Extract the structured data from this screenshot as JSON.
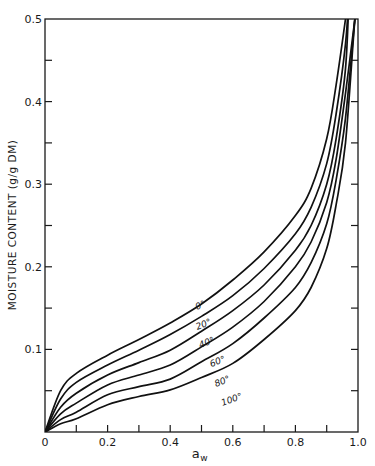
{
  "chart_data": {
    "type": "line",
    "title": "",
    "xlabel": "a_w",
    "xlabel_main": "a",
    "xlabel_sub": "w",
    "ylabel": "MOISTURE CONTENT (g/g DM)",
    "xlim": [
      0,
      1.0
    ],
    "ylim": [
      0,
      0.5
    ],
    "grid": false,
    "legend_position": "inline labels on curves",
    "x_ticks": [
      0,
      0.1,
      0.2,
      0.3,
      0.4,
      0.5,
      0.6,
      0.7,
      0.8,
      0.9,
      1.0
    ],
    "x_tick_labels": [
      "0",
      "",
      "0.2",
      "",
      "0.4",
      "",
      "0.6",
      "",
      "0.8",
      "",
      "1.0"
    ],
    "y_ticks": [
      0,
      0.05,
      0.1,
      0.15,
      0.2,
      0.25,
      0.3,
      0.35,
      0.4,
      0.45,
      0.5
    ],
    "y_tick_labels": [
      "",
      "",
      "0.1",
      "",
      "0.2",
      "",
      "0.3",
      "",
      "0.4",
      "",
      "0.5"
    ],
    "x": [
      0,
      0.05,
      0.1,
      0.2,
      0.3,
      0.4,
      0.5,
      0.6,
      0.7,
      0.8,
      0.85,
      0.9,
      0.93,
      0.96,
      0.99
    ],
    "series": [
      {
        "name": "0°",
        "values": [
          0,
          0.05,
          0.071,
          0.093,
          0.112,
          0.132,
          0.155,
          0.184,
          0.218,
          0.262,
          0.295,
          0.355,
          0.42,
          0.5,
          null
        ]
      },
      {
        "name": "20°",
        "values": [
          0,
          0.04,
          0.06,
          0.081,
          0.099,
          0.118,
          0.14,
          0.165,
          0.198,
          0.24,
          0.272,
          0.325,
          0.385,
          0.47,
          null
        ]
      },
      {
        "name": "40°",
        "values": [
          0,
          0.03,
          0.047,
          0.069,
          0.084,
          0.099,
          0.122,
          0.147,
          0.178,
          0.22,
          0.25,
          0.3,
          0.355,
          0.44,
          null
        ]
      },
      {
        "name": "60°",
        "values": [
          0,
          0.022,
          0.035,
          0.057,
          0.069,
          0.081,
          0.103,
          0.127,
          0.158,
          0.2,
          0.23,
          0.278,
          0.33,
          0.41,
          0.5
        ]
      },
      {
        "name": "80°",
        "values": [
          0,
          0.015,
          0.024,
          0.045,
          0.055,
          0.064,
          0.085,
          0.107,
          0.138,
          0.175,
          0.205,
          0.252,
          0.305,
          0.38,
          0.5
        ]
      },
      {
        "name": "100°",
        "values": [
          0,
          0.01,
          0.016,
          0.033,
          0.043,
          0.051,
          0.066,
          0.083,
          0.112,
          0.147,
          0.175,
          0.222,
          0.275,
          0.35,
          0.5
        ]
      }
    ],
    "curve_labels": [
      "0°",
      "20°",
      "40°",
      "60°",
      "80°",
      "100°"
    ]
  }
}
